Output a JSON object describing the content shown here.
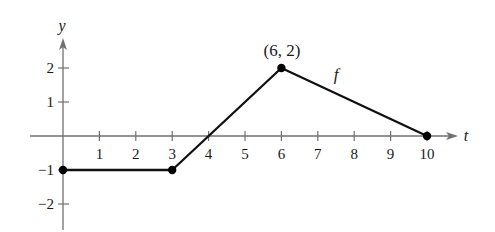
{
  "chart_data": {
    "type": "line",
    "title": "",
    "xlabel": "t",
    "ylabel": "y",
    "xlim": [
      0,
      10
    ],
    "ylim": [
      -2,
      2
    ],
    "grid": false,
    "x_ticks": [
      1,
      2,
      3,
      4,
      5,
      6,
      7,
      8,
      9,
      10
    ],
    "y_ticks": [
      2,
      1,
      -1,
      -2
    ],
    "x_tick_labels": [
      "1",
      "2",
      "3",
      "4",
      "5",
      "6",
      "7",
      "8",
      "9",
      "10"
    ],
    "y_tick_labels": [
      "2",
      "1",
      "−1",
      "−2"
    ],
    "series": [
      {
        "name": "f",
        "x": [
          0,
          3,
          6,
          10
        ],
        "values": [
          -1,
          -1,
          2,
          0
        ]
      }
    ],
    "marked_points": [
      [
        0,
        -1
      ],
      [
        3,
        -1
      ],
      [
        6,
        2
      ],
      [
        10,
        0
      ]
    ],
    "annotations": [
      {
        "text": "(6, 2)",
        "x": 6,
        "y": 2
      },
      {
        "text": "f",
        "label_for": "series"
      }
    ],
    "legend": "none"
  },
  "labels": {
    "x_axis": "t",
    "y_axis": "y",
    "point_annotation": "(6, 2)",
    "function_name": "f"
  },
  "style": {
    "axis_color": "#707070",
    "line_color": "#111111",
    "point_color": "#000000"
  }
}
